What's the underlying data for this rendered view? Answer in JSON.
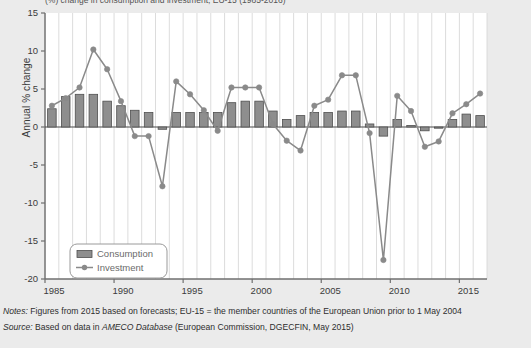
{
  "figure": {
    "clipped_title": "(%) change in consumption and investment, EU-15 (1985-2016)"
  },
  "axes": {
    "ylabel": "Annual % change",
    "yticks": [
      15,
      10,
      5,
      0,
      -5,
      -10,
      -15,
      -20
    ],
    "ytick_labels": [
      "15",
      "10",
      "5",
      "0",
      "-5",
      "-10",
      "-15",
      "-20"
    ],
    "xtick_labels": [
      "1985",
      "1990",
      "1995",
      "2000",
      "2005",
      "2010",
      "2015"
    ],
    "xticks": [
      1985,
      1990,
      1995,
      2000,
      2005,
      2010,
      2015
    ]
  },
  "legend": {
    "position": "bottom-left",
    "items": [
      {
        "label": "Consumption",
        "marker": "bar",
        "color": "#8e8e8e"
      },
      {
        "label": "Investment",
        "marker": "line-dot",
        "color": "#8a8a8a"
      }
    ]
  },
  "notes": {
    "notes_label": "Notes:",
    "notes_text": " Figures from 2015 based on forecasts; EU-15 = the member countries of the European Union prior to 1 May 2004",
    "source_label": "Source:",
    "source_pre": " Based on data in ",
    "source_italic": "AMECO Database",
    "source_post": " (European Commission, DGECFIN, May 2015)"
  },
  "colors": {
    "bar_fill": "#8e8e8e",
    "bar_edge": "#4f4f4f",
    "line": "#8a8a8a",
    "marker": "#8a8a8a",
    "grid": "#d8d8d8",
    "axis": "#6f6f6f",
    "plot_bg": "#ffffff",
    "page_bg": "#ebebeb"
  },
  "chart_data": {
    "type": "bar",
    "xlabel": "",
    "ylabel": "Annual % change",
    "ylim": [
      -20,
      15
    ],
    "xlim": [
      1984.5,
      2016.5
    ],
    "grid": "vertical",
    "legend_position": "bottom-left",
    "categories": [
      1985,
      1986,
      1987,
      1988,
      1989,
      1990,
      1991,
      1992,
      1993,
      1994,
      1995,
      1996,
      1997,
      1998,
      1999,
      2000,
      2001,
      2002,
      2003,
      2004,
      2005,
      2006,
      2007,
      2008,
      2009,
      2010,
      2011,
      2012,
      2013,
      2014,
      2015,
      2016
    ],
    "series": [
      {
        "name": "Consumption",
        "type": "bar",
        "values": [
          2.4,
          4.0,
          4.3,
          4.3,
          3.4,
          2.8,
          2.2,
          1.9,
          -0.3,
          1.9,
          1.9,
          1.9,
          1.9,
          3.2,
          3.4,
          3.4,
          2.1,
          1.0,
          1.5,
          1.9,
          1.9,
          2.1,
          2.1,
          0.4,
          -1.2,
          1.0,
          0.2,
          -0.5,
          -0.1,
          1.0,
          1.7,
          1.5
        ]
      },
      {
        "name": "Investment",
        "type": "line",
        "values": [
          2.8,
          3.8,
          5.2,
          10.2,
          7.6,
          3.4,
          -1.2,
          -1.2,
          -7.8,
          6.0,
          4.3,
          2.2,
          -0.5,
          5.2,
          5.2,
          5.2,
          0.4,
          -1.8,
          -3.1,
          2.8,
          3.6,
          6.8,
          6.8,
          -0.8,
          -17.5,
          4.1,
          2.1,
          -2.6,
          -1.9,
          1.8,
          3.0,
          4.4
        ]
      }
    ]
  }
}
